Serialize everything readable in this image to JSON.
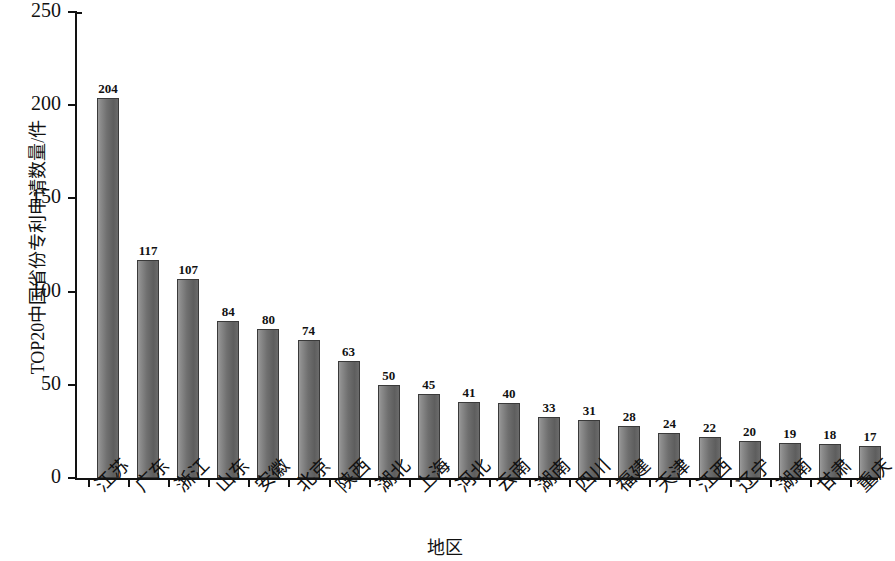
{
  "chart_data": {
    "type": "bar",
    "title": "",
    "xlabel": "地区",
    "ylabel": "TOP20中国省份专利申请数量/件",
    "ylim": [
      0,
      250
    ],
    "yticks": [
      0,
      50,
      100,
      150,
      200,
      250
    ],
    "grid": false,
    "legend": null,
    "bar_color": "#6f6f6f",
    "bar_edge_color": "#3a3a3a",
    "axis_color": "#121212",
    "background_color": "#ffffff",
    "categories": [
      "江苏",
      "广东",
      "浙江",
      "山东",
      "安徽",
      "北京",
      "陕西",
      "湖北",
      "上海",
      "河北",
      "云南",
      "湖南",
      "四川",
      "福建",
      "天津",
      "江西",
      "辽宁",
      "湖南",
      "甘肃",
      "重庆"
    ],
    "values": [
      204,
      117,
      107,
      84,
      80,
      74,
      63,
      50,
      45,
      41,
      40,
      33,
      31,
      28,
      24,
      22,
      20,
      19,
      18,
      17
    ],
    "value_labels": [
      "204",
      "117",
      "107",
      "84",
      "80",
      "74",
      "63",
      "50",
      "45",
      "41",
      "40",
      "33",
      "31",
      "28",
      "24",
      "22",
      "20",
      "19",
      "18",
      "17"
    ],
    "ytick_labels": [
      "0",
      "50",
      "100",
      "150",
      "200",
      "250"
    ]
  }
}
